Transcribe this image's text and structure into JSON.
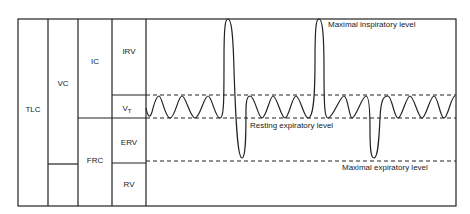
{
  "diagram": {
    "columns": {
      "col1": {
        "label": "TLC"
      },
      "col2": {
        "label": "VC"
      },
      "col3_top": {
        "label": "IC"
      },
      "col3_bottom": {
        "label": "FRC"
      },
      "col4": [
        {
          "label": "IRV"
        },
        {
          "label": "V",
          "subscript": "T"
        },
        {
          "label": "ERV"
        },
        {
          "label": "RV"
        }
      ]
    },
    "annotations": {
      "max_inspiratory": "Maximal inspiratory level",
      "resting_expiratory": "Resting expiratory level",
      "max_expiratory": "Maximal expiratory level"
    },
    "colors": {
      "line": "#222222",
      "background": "#ffffff"
    }
  }
}
